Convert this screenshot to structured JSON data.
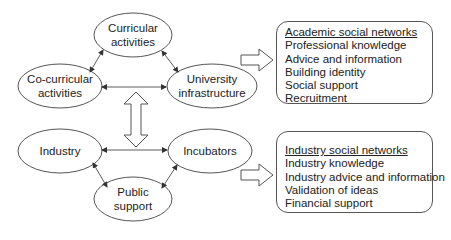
{
  "diagram": {
    "university_cluster": {
      "nodes": [
        {
          "id": "curricular",
          "label_line1": "Curricular",
          "label_line2": "activities"
        },
        {
          "id": "co_curricular",
          "label_line1": "Co-curricular",
          "label_line2": "activities"
        },
        {
          "id": "university_infrastructure",
          "label_line1": "University",
          "label_line2": "infrastructure"
        }
      ]
    },
    "industry_cluster": {
      "nodes": [
        {
          "id": "industry",
          "label_line1": "Industry"
        },
        {
          "id": "incubators",
          "label_line1": "Incubators"
        },
        {
          "id": "public_support",
          "label_line1": "Public",
          "label_line2": "support"
        }
      ]
    },
    "edges": [
      {
        "from": "curricular",
        "to": "co_curricular",
        "type": "bidirectional"
      },
      {
        "from": "curricular",
        "to": "university_infrastructure",
        "type": "bidirectional"
      },
      {
        "from": "co_curricular",
        "to": "university_infrastructure",
        "type": "bidirectional"
      },
      {
        "from": "industry",
        "to": "incubators",
        "type": "bidirectional"
      },
      {
        "from": "industry",
        "to": "public_support",
        "type": "bidirectional"
      },
      {
        "from": "incubators",
        "to": "public_support",
        "type": "bidirectional"
      },
      {
        "from": "university_cluster",
        "to": "industry_cluster",
        "type": "hollow-bidirectional"
      },
      {
        "from": "university_cluster",
        "to": "academic_box",
        "type": "hollow-arrow"
      },
      {
        "from": "industry_cluster",
        "to": "industry_box",
        "type": "hollow-arrow"
      }
    ],
    "academic_box": {
      "title": "Academic social networks",
      "items": [
        "Professional knowledge",
        "Advice and information",
        "Building identity",
        "Social support",
        "Recruitment"
      ]
    },
    "industry_box": {
      "title": "Industry social networks",
      "items": [
        "Industry knowledge",
        "Industry advice and information",
        "Validation of ideas",
        "Financial support"
      ]
    }
  }
}
